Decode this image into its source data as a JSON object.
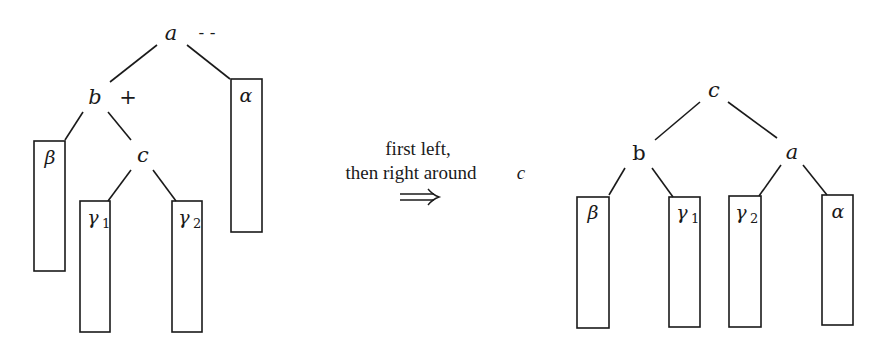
{
  "diagram": {
    "left_tree": {
      "nodes": {
        "a": {
          "label": "a",
          "annotation": "- -"
        },
        "b": {
          "label": "b",
          "annotation": "+"
        },
        "c": {
          "label": "c"
        }
      },
      "subtrees": {
        "beta": {
          "label": "β"
        },
        "gamma1": {
          "label": "γ",
          "sub": "1"
        },
        "gamma2": {
          "label": "γ",
          "sub": "2"
        },
        "alpha": {
          "label": "α"
        }
      }
    },
    "caption": {
      "line1": "first left,",
      "line2": "then right around",
      "line2_var": "c",
      "arrow": "⟹"
    },
    "right_tree": {
      "nodes": {
        "c": {
          "label": "c"
        },
        "b": {
          "label": "b"
        },
        "a": {
          "label": "a"
        }
      },
      "subtrees": {
        "beta": {
          "label": "β"
        },
        "gamma1": {
          "label": "γ",
          "sub": "1"
        },
        "gamma2": {
          "label": "γ",
          "sub": "2"
        },
        "alpha": {
          "label": "α"
        }
      }
    }
  }
}
